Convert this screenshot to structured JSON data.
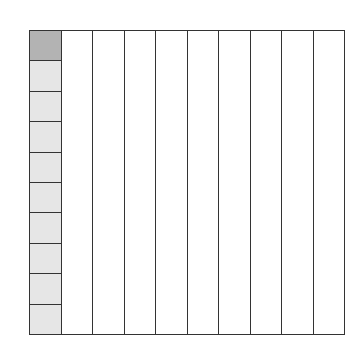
{
  "diagram": {
    "type": "hundred-grid",
    "columns": 10,
    "rows": 10,
    "first_column_cells": [
      {
        "shade": "dark",
        "color": "#b3b3b3"
      },
      {
        "shade": "light",
        "color": "#e6e6e6"
      },
      {
        "shade": "light",
        "color": "#e6e6e6"
      },
      {
        "shade": "light",
        "color": "#e6e6e6"
      },
      {
        "shade": "light",
        "color": "#e6e6e6"
      },
      {
        "shade": "light",
        "color": "#e6e6e6"
      },
      {
        "shade": "light",
        "color": "#e6e6e6"
      },
      {
        "shade": "light",
        "color": "#e6e6e6"
      },
      {
        "shade": "light",
        "color": "#e6e6e6"
      },
      {
        "shade": "light",
        "color": "#e6e6e6"
      }
    ],
    "line_color": "#333333",
    "background": "#ffffff"
  }
}
